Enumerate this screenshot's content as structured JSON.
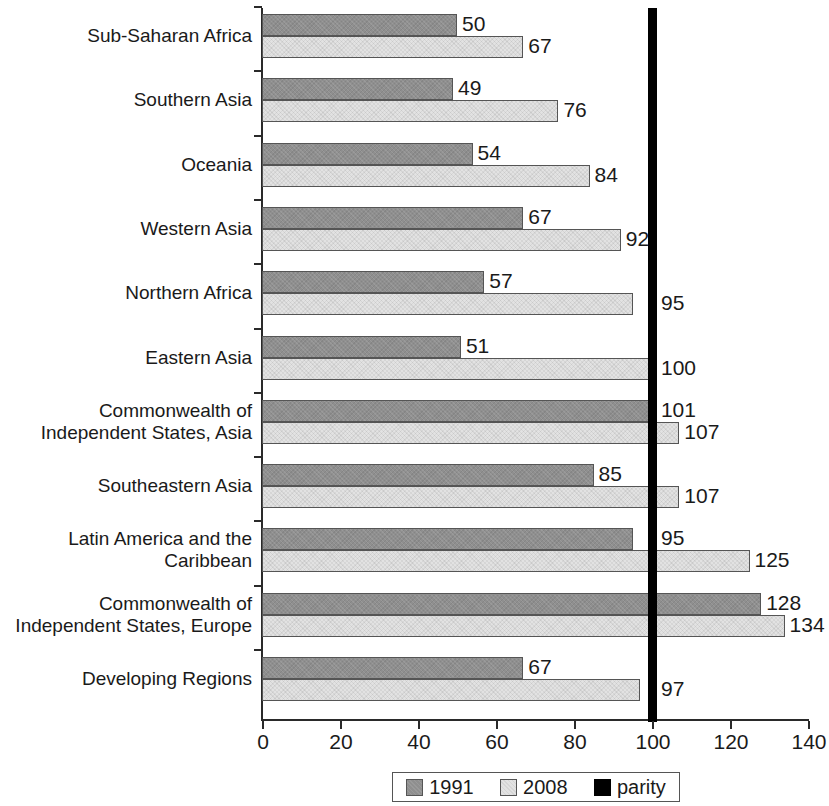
{
  "chart_data": {
    "type": "bar",
    "orientation": "horizontal",
    "title": "",
    "subtitle": "",
    "xlabel": "",
    "ylabel": "",
    "xlim": [
      0,
      140
    ],
    "x_ticks": [
      0,
      20,
      40,
      60,
      80,
      100,
      120,
      140
    ],
    "grid": false,
    "legend_position": "bottom",
    "categories": [
      "Sub-Saharan Africa",
      "Southern Asia",
      "Oceania",
      "Western Asia",
      "Northern Africa",
      "Eastern Asia",
      "Commonwealth of\nIndependent States, Asia",
      "Southeastern Asia",
      "Latin America and the\nCaribbean",
      "Commonwealth of\nIndependent States, Europe",
      "Developing Regions"
    ],
    "series": [
      {
        "name": "1991",
        "color": "#8f8f8f",
        "values": [
          50,
          49,
          54,
          67,
          57,
          51,
          101,
          85,
          95,
          128,
          67
        ]
      },
      {
        "name": "2008",
        "color": "#e2e2e2",
        "values": [
          67,
          76,
          84,
          92,
          95,
          100,
          107,
          107,
          125,
          134,
          97
        ]
      }
    ],
    "reference_line": {
      "name": "parity",
      "value": 100,
      "color": "#000000"
    }
  },
  "legend": {
    "items": [
      {
        "label": "1991",
        "swatch": "series-1991-swatch"
      },
      {
        "label": "2008",
        "swatch": "series-2008-swatch"
      },
      {
        "label": "parity",
        "swatch": "parity-swatch"
      }
    ]
  }
}
